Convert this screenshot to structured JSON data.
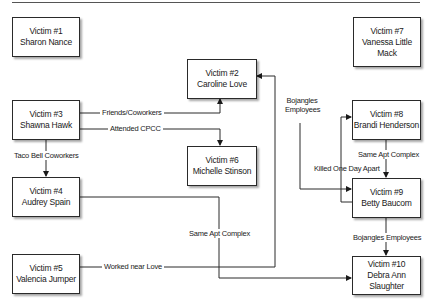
{
  "diagram": {
    "nodes": [
      {
        "id": "v1",
        "title": "Victim #1",
        "name_lines": [
          "Sharon Nance"
        ]
      },
      {
        "id": "v2",
        "title": "Victim #2",
        "name_lines": [
          "Caroline Love"
        ]
      },
      {
        "id": "v3",
        "title": "Victim #3",
        "name_lines": [
          "Shawna Hawk"
        ]
      },
      {
        "id": "v4",
        "title": "Victim #4",
        "name_lines": [
          "Audrey Spain"
        ]
      },
      {
        "id": "v5",
        "title": "Victim #5",
        "name_lines": [
          "Valencia Jumper"
        ]
      },
      {
        "id": "v6",
        "title": "Victim #6",
        "name_lines": [
          "Michelle Stinson"
        ]
      },
      {
        "id": "v7",
        "title": "Victim #7",
        "name_lines": [
          "Vanessa Little",
          "Mack"
        ]
      },
      {
        "id": "v8",
        "title": "Victim #8",
        "name_lines": [
          "Brandi Henderson"
        ]
      },
      {
        "id": "v9",
        "title": "Victim #9",
        "name_lines": [
          "Betty Baucom"
        ]
      },
      {
        "id": "v10",
        "title": "Victim #10",
        "name_lines": [
          "Debra Ann",
          "Slaughter"
        ]
      }
    ],
    "edges": [
      {
        "from": "v3",
        "to": "v2",
        "label": "Friends/Coworkers"
      },
      {
        "from": "v3",
        "to": "v6",
        "label": "Attended CPCC"
      },
      {
        "from": "v3",
        "to": "v4",
        "label": "Taco Bell Coworkers"
      },
      {
        "from": "v4",
        "to": "v10",
        "label": "Same Apt Complex"
      },
      {
        "from": "v5",
        "to": "v2",
        "label": "Worked near Love"
      },
      {
        "from": "v2",
        "to": "v9",
        "label_lines": [
          "Bojangles",
          "Employees"
        ]
      },
      {
        "from": "v9",
        "to": "v8",
        "label": "Killed One Day Apart"
      },
      {
        "from": "v8",
        "to": "v9",
        "label": "Same Apt Complex"
      },
      {
        "from": "v9",
        "to": "v10",
        "label": "Bojangles Employees"
      }
    ]
  }
}
